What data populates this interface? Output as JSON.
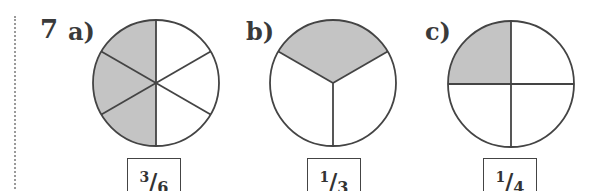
{
  "question": {
    "number": "7",
    "parts": [
      {
        "label": "a)",
        "slices": 6,
        "shaded": 3,
        "answer": {
          "numerator": "3",
          "denominator": "6"
        }
      },
      {
        "label": "b)",
        "slices": 3,
        "shaded": 1,
        "answer": {
          "numerator": "1",
          "denominator": "3"
        }
      },
      {
        "label": "c)",
        "slices": 4,
        "shaded": 1,
        "answer": {
          "numerator": "1",
          "denominator": "4"
        }
      }
    ]
  },
  "colors": {
    "shade": "#c4c4c4",
    "stroke": "#444444"
  }
}
